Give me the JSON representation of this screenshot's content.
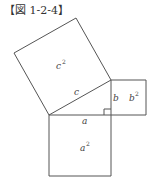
{
  "figure": {
    "title": "【図 1-2-4】"
  },
  "diagram": {
    "stroke_color": "#555555",
    "triangle": {
      "vertices": [
        [
          49,
          115
        ],
        [
          111,
          115
        ],
        [
          111,
          80
        ]
      ],
      "right_angle_at": [
        111,
        115
      ]
    },
    "squares": {
      "hypotenuse": {
        "points": "49,115 111,80 76,18 14,53"
      },
      "leg_b": {
        "points": "111,80 146,80 146,115 111,115"
      },
      "leg_a": {
        "points": "49,115 111,115 111,176 49,176"
      }
    },
    "labels": {
      "c_square": {
        "base": "c",
        "exp": "2"
      },
      "c_side": "c",
      "b_side": "b",
      "b_square": {
        "base": "b",
        "exp": "2"
      },
      "a_side": "a",
      "a_square": {
        "base": "a",
        "exp": "2"
      }
    }
  }
}
